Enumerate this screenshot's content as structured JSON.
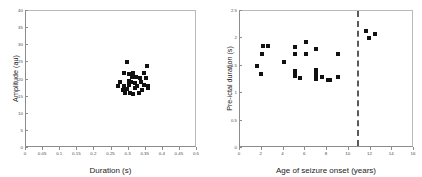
{
  "figure": {
    "background": "#ffffff",
    "marker_color": "#111111",
    "axis_color": "#8c8c8c",
    "vline_color": "#5a5a5a"
  },
  "chart_data": [
    {
      "type": "scatter",
      "panel": "left",
      "title": "",
      "xlabel": "Duration (s)",
      "ylabel": "Amplitude (au)",
      "xlim": [
        0,
        0.5
      ],
      "ylim": [
        0,
        40
      ],
      "xticks": [
        0,
        0.05,
        0.1,
        0.15,
        0.2,
        0.25,
        0.3,
        0.35,
        0.4,
        0.45,
        0.5
      ],
      "xticklabels": [
        "0",
        "0.05",
        "0.1",
        "0.15",
        "0.2",
        "0.25",
        "0.3",
        "0.35",
        "0.4",
        "0.45",
        "0.5"
      ],
      "yticks": [
        0,
        5,
        10,
        15,
        20,
        25,
        30,
        35,
        40
      ],
      "yticklabels": [
        "0",
        "5",
        "10",
        "15",
        "20",
        "25",
        "30",
        "35",
        "40"
      ],
      "grid": false,
      "legend": null,
      "points": [
        {
          "x": 0.295,
          "y": 25.0
        },
        {
          "x": 0.355,
          "y": 24.0
        },
        {
          "x": 0.287,
          "y": 21.8
        },
        {
          "x": 0.3,
          "y": 21.6
        },
        {
          "x": 0.312,
          "y": 21.9
        },
        {
          "x": 0.345,
          "y": 22.0
        },
        {
          "x": 0.31,
          "y": 20.6
        },
        {
          "x": 0.322,
          "y": 20.8
        },
        {
          "x": 0.333,
          "y": 20.4
        },
        {
          "x": 0.352,
          "y": 20.3
        },
        {
          "x": 0.276,
          "y": 19.3
        },
        {
          "x": 0.3,
          "y": 19.6
        },
        {
          "x": 0.308,
          "y": 19.4
        },
        {
          "x": 0.318,
          "y": 19.0
        },
        {
          "x": 0.336,
          "y": 19.2
        },
        {
          "x": 0.27,
          "y": 18.2
        },
        {
          "x": 0.288,
          "y": 18.1
        },
        {
          "x": 0.302,
          "y": 18.4
        },
        {
          "x": 0.326,
          "y": 18.0
        },
        {
          "x": 0.344,
          "y": 18.3
        },
        {
          "x": 0.358,
          "y": 18.2
        },
        {
          "x": 0.283,
          "y": 17.0
        },
        {
          "x": 0.296,
          "y": 17.2
        },
        {
          "x": 0.318,
          "y": 17.4
        },
        {
          "x": 0.339,
          "y": 17.0
        },
        {
          "x": 0.356,
          "y": 17.6
        },
        {
          "x": 0.289,
          "y": 16.2
        },
        {
          "x": 0.304,
          "y": 16.0
        },
        {
          "x": 0.33,
          "y": 16.1
        },
        {
          "x": 0.313,
          "y": 15.9
        }
      ]
    },
    {
      "type": "scatter",
      "panel": "right",
      "title": "",
      "xlabel": "Age of seizure onset (years)",
      "ylabel": "Pre-ictal duration (s)",
      "xlim": [
        0,
        16
      ],
      "ylim": [
        0,
        2.5
      ],
      "xticks": [
        0,
        2,
        4,
        6,
        8,
        10,
        12,
        14,
        16
      ],
      "xticklabels": [
        "0",
        "2",
        "4",
        "6",
        "8",
        "10",
        "12",
        "14",
        "16"
      ],
      "yticks": [
        0,
        0.5,
        1,
        1.5,
        2,
        2.5
      ],
      "yticklabels": [
        "0",
        "0.5",
        "1",
        "1.5",
        "2",
        "2.5"
      ],
      "grid": false,
      "legend": null,
      "vline": {
        "x": 10.8,
        "style": "dashed"
      },
      "points": [
        {
          "x": 1.55,
          "y": 1.5
        },
        {
          "x": 1.95,
          "y": 1.35
        },
        {
          "x": 2.05,
          "y": 1.72
        },
        {
          "x": 2.15,
          "y": 1.86
        },
        {
          "x": 2.55,
          "y": 1.87
        },
        {
          "x": 4.05,
          "y": 1.57
        },
        {
          "x": 5.05,
          "y": 1.85
        },
        {
          "x": 5.05,
          "y": 1.71
        },
        {
          "x": 5.05,
          "y": 1.4
        },
        {
          "x": 5.05,
          "y": 1.35
        },
        {
          "x": 5.05,
          "y": 1.31
        },
        {
          "x": 5.55,
          "y": 1.27
        },
        {
          "x": 6.05,
          "y": 1.93
        },
        {
          "x": 6.05,
          "y": 1.71
        },
        {
          "x": 7.0,
          "y": 1.81
        },
        {
          "x": 7.0,
          "y": 1.42
        },
        {
          "x": 7.0,
          "y": 1.36
        },
        {
          "x": 7.0,
          "y": 1.31
        },
        {
          "x": 7.0,
          "y": 1.26
        },
        {
          "x": 7.55,
          "y": 1.3
        },
        {
          "x": 8.05,
          "y": 1.25
        },
        {
          "x": 8.25,
          "y": 1.24
        },
        {
          "x": 9.05,
          "y": 1.71
        },
        {
          "x": 9.05,
          "y": 1.29
        },
        {
          "x": 11.55,
          "y": 2.14
        },
        {
          "x": 11.9,
          "y": 2.0
        },
        {
          "x": 12.4,
          "y": 2.08
        }
      ]
    }
  ]
}
